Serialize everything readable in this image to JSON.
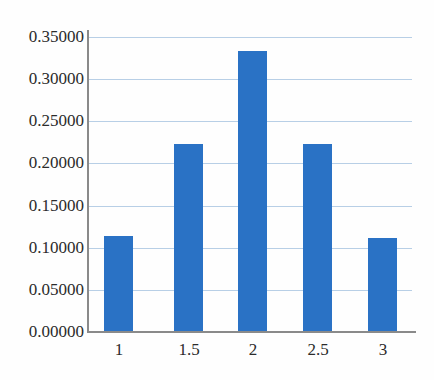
{
  "chart_data": {
    "type": "bar",
    "title": "",
    "subtitle": "",
    "xlabel": "",
    "ylabel": "",
    "categories": [
      "1",
      "1.5",
      "2",
      "2.5",
      "3"
    ],
    "values": [
      0.114,
      0.223,
      0.3333,
      0.223,
      0.112
    ],
    "series": [
      {
        "name": "",
        "values": [
          0.114,
          0.223,
          0.3333,
          0.223,
          0.112
        ]
      }
    ],
    "ylim": [
      0.0,
      0.35
    ],
    "xlim": [
      0.75,
      3.25
    ],
    "ytick_labels": [
      "0.00000",
      "0.05000",
      "0.10000",
      "0.15000",
      "0.20000",
      "0.25000",
      "0.30000",
      "0.35000"
    ],
    "ytick_values": [
      0.0,
      0.05,
      0.1,
      0.15,
      0.2,
      0.25,
      0.3,
      0.35
    ],
    "xtick_labels": [
      "1",
      "1.5",
      "2",
      "2.5",
      "3"
    ],
    "xtick_values": [
      1,
      1.5,
      2,
      2.5,
      3
    ],
    "grid": "horizontal",
    "legend": "none",
    "annotations": [],
    "colors": {
      "bar": "#2a72c5",
      "gridline": "#b8cfe6",
      "axis": "#8a8a8a",
      "text": "#2b2b2b",
      "background": "#fefefe"
    }
  }
}
